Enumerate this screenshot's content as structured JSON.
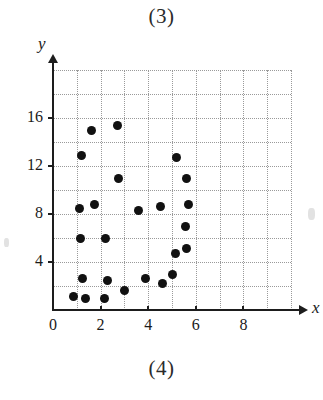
{
  "figure": {
    "label_top": "(3)",
    "label_bottom": "(4)"
  },
  "chart_data": {
    "type": "scatter",
    "title": "",
    "subtitle": "",
    "xlabel": "x",
    "ylabel": "y",
    "xlim": [
      0,
      10
    ],
    "ylim": [
      0,
      20
    ],
    "xticks": [
      0,
      2,
      4,
      6,
      8
    ],
    "yticks": [
      4,
      8,
      12,
      16
    ],
    "xtick_labels": [
      "0",
      "2",
      "4",
      "6",
      "8"
    ],
    "ytick_labels": [
      "4",
      "8",
      "12",
      "16"
    ],
    "grid": true,
    "grid_style": "dotted",
    "grid_x_step": 1,
    "grid_y_step": 2,
    "legend": null,
    "legend_position": "none",
    "annotations": [],
    "marker": "filled-circle",
    "marker_color": "#111111",
    "axis_color": "#1d1d1d",
    "grid_color": "#9a9a9a",
    "points": [
      {
        "x": 0.85,
        "y": 1.1
      },
      {
        "x": 1.15,
        "y": 6.0
      },
      {
        "x": 1.1,
        "y": 8.5
      },
      {
        "x": 1.2,
        "y": 12.9
      },
      {
        "x": 1.25,
        "y": 2.6
      },
      {
        "x": 1.35,
        "y": 1.0
      },
      {
        "x": 1.6,
        "y": 15.0
      },
      {
        "x": 1.75,
        "y": 8.8
      },
      {
        "x": 2.15,
        "y": 1.0
      },
      {
        "x": 2.2,
        "y": 6.0
      },
      {
        "x": 2.3,
        "y": 2.5
      },
      {
        "x": 2.7,
        "y": 15.4
      },
      {
        "x": 2.75,
        "y": 11.0
      },
      {
        "x": 3.0,
        "y": 1.6
      },
      {
        "x": 3.6,
        "y": 8.3
      },
      {
        "x": 3.9,
        "y": 2.6
      },
      {
        "x": 4.5,
        "y": 8.6
      },
      {
        "x": 4.6,
        "y": 2.2
      },
      {
        "x": 5.0,
        "y": 3.0
      },
      {
        "x": 5.15,
        "y": 4.7
      },
      {
        "x": 5.2,
        "y": 12.7
      },
      {
        "x": 5.55,
        "y": 7.0
      },
      {
        "x": 5.6,
        "y": 5.1
      },
      {
        "x": 5.6,
        "y": 11.0
      },
      {
        "x": 5.7,
        "y": 8.8
      }
    ]
  }
}
